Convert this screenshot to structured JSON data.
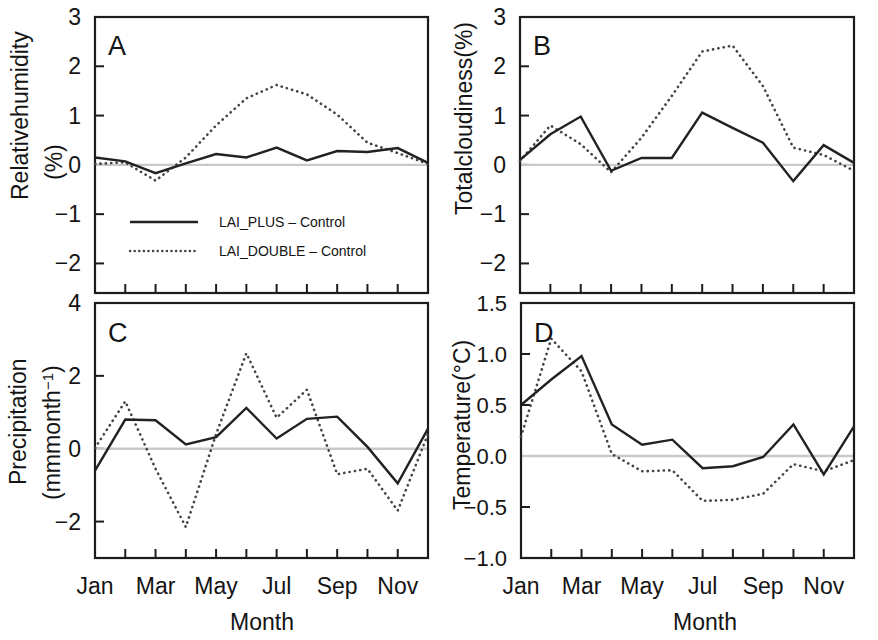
{
  "figure": {
    "xlabel": "Month",
    "month_ticks": [
      "Jan",
      "Feb",
      "Mar",
      "Apr",
      "May",
      "Jun",
      "Jul",
      "Aug",
      "Sep",
      "Oct",
      "Nov",
      "Dec"
    ],
    "month_tick_labels": [
      "Jan",
      "Mar",
      "May",
      "Jul",
      "Sep",
      "Nov"
    ],
    "legend": {
      "solid_label": "LAI_PLUS – Control",
      "dotted_label": "LAI_DOUBLE – Control"
    },
    "colors": {
      "solid": "#222222",
      "dotted": "#444444",
      "frame": "#1c1c1c",
      "zeroline": "#c9c9c9",
      "background": "#ffffff"
    }
  },
  "chart_data": [
    {
      "type": "line",
      "panel": "A",
      "title": "",
      "ylabel_line1": "Relativehumidity",
      "ylabel_line2": "(%)",
      "xlabel": "Month",
      "categories": [
        "Jan",
        "Feb",
        "Mar",
        "Apr",
        "May",
        "Jun",
        "Jul",
        "Aug",
        "Sep",
        "Oct",
        "Nov",
        "Dec"
      ],
      "ylim": [
        -2.6,
        3.0
      ],
      "yticks": [
        3,
        2,
        1,
        0,
        -1,
        -2
      ],
      "ytick_labels": [
        "3",
        "2",
        "1",
        "0",
        "−1",
        "−2"
      ],
      "grid": false,
      "zero_reference": 0,
      "legend_position": "inside-lower-left",
      "series": [
        {
          "name": "LAI_PLUS – Control",
          "style": "solid",
          "values": [
            0.15,
            0.07,
            -0.17,
            0.03,
            0.22,
            0.15,
            0.35,
            0.09,
            0.28,
            0.26,
            0.34,
            0.04
          ]
        },
        {
          "name": "LAI_DOUBLE – Control",
          "style": "dotted",
          "values": [
            0.02,
            0.05,
            -0.32,
            0.15,
            0.8,
            1.35,
            1.62,
            1.43,
            1.02,
            0.45,
            0.24,
            0.02
          ]
        }
      ]
    },
    {
      "type": "line",
      "panel": "B",
      "title": "",
      "ylabel_line1": "Totalcloudiness(%)",
      "ylabel_line2": "",
      "xlabel": "Month",
      "categories": [
        "Jan",
        "Feb",
        "Mar",
        "Apr",
        "May",
        "Jun",
        "Jul",
        "Aug",
        "Sep",
        "Oct",
        "Nov",
        "Dec"
      ],
      "ylim": [
        -2.6,
        3.0
      ],
      "yticks": [
        3,
        2,
        1,
        0,
        -1,
        -2
      ],
      "ytick_labels": [
        "3",
        "2",
        "1",
        "0",
        "−1",
        "−2"
      ],
      "grid": false,
      "zero_reference": 0,
      "series": [
        {
          "name": "LAI_PLUS – Control",
          "style": "solid",
          "values": [
            0.1,
            0.62,
            0.98,
            -0.12,
            0.14,
            0.14,
            1.06,
            0.75,
            0.45,
            -0.33,
            0.4,
            0.04
          ]
        },
        {
          "name": "LAI_DOUBLE – Control",
          "style": "dotted",
          "values": [
            0.08,
            0.8,
            0.42,
            -0.15,
            0.55,
            1.4,
            2.3,
            2.42,
            1.6,
            0.35,
            0.2,
            -0.12
          ]
        }
      ]
    },
    {
      "type": "line",
      "panel": "C",
      "title": "",
      "ylabel_line1": "Precipitation",
      "ylabel_line2": "(mmmonth⁻¹)",
      "xlabel": "Month",
      "categories": [
        "Jan",
        "Feb",
        "Mar",
        "Apr",
        "May",
        "Jun",
        "Jul",
        "Aug",
        "Sep",
        "Oct",
        "Nov",
        "Dec"
      ],
      "ylim": [
        -3.0,
        4.0
      ],
      "yticks": [
        4,
        2,
        0,
        -2
      ],
      "ytick_labels": [
        "4",
        "2",
        "0",
        "−2"
      ],
      "grid": false,
      "zero_reference": 0,
      "series": [
        {
          "name": "LAI_PLUS – Control",
          "style": "solid",
          "values": [
            -0.6,
            0.8,
            0.78,
            0.12,
            0.32,
            1.12,
            0.28,
            0.82,
            0.88,
            0.05,
            -0.95,
            0.55
          ]
        },
        {
          "name": "LAI_DOUBLE – Control",
          "style": "dotted",
          "values": [
            0.02,
            1.3,
            -0.55,
            -2.15,
            0.4,
            2.62,
            0.85,
            1.62,
            -0.7,
            -0.55,
            -1.7,
            0.4
          ]
        }
      ]
    },
    {
      "type": "line",
      "panel": "D",
      "title": "",
      "ylabel_line1": "Temperature(°C)",
      "ylabel_line2": "",
      "xlabel": "Month",
      "categories": [
        "Jan",
        "Feb",
        "Mar",
        "Apr",
        "May",
        "Jun",
        "Jul",
        "Aug",
        "Sep",
        "Oct",
        "Nov",
        "Dec"
      ],
      "ylim": [
        -1.0,
        1.5
      ],
      "yticks": [
        1.5,
        1.0,
        0.5,
        0.0,
        -0.5,
        -1.0
      ],
      "ytick_labels": [
        "1.5",
        "1.0",
        "0.5",
        "0.0",
        "−0.5",
        "−1.0"
      ],
      "grid": false,
      "zero_reference": 0,
      "series": [
        {
          "name": "LAI_PLUS – Control",
          "style": "solid",
          "values": [
            0.5,
            0.75,
            0.98,
            0.31,
            0.11,
            0.16,
            -0.12,
            -0.1,
            -0.01,
            0.31,
            -0.18,
            0.29
          ]
        },
        {
          "name": "LAI_DOUBLE – Control",
          "style": "dotted",
          "values": [
            0.19,
            1.15,
            0.83,
            0.02,
            -0.15,
            -0.14,
            -0.44,
            -0.43,
            -0.37,
            -0.08,
            -0.15,
            -0.04
          ]
        }
      ]
    }
  ]
}
